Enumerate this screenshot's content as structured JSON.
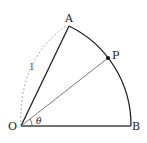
{
  "diagram": {
    "type": "sector",
    "points": {
      "O": {
        "label": "O"
      },
      "A": {
        "label": "A"
      },
      "B": {
        "label": "B"
      },
      "P": {
        "label": "P"
      }
    },
    "radius_label": "1",
    "angle_label": "θ",
    "colors": {
      "stroke": "#222222",
      "dashed": "#999999",
      "segment_op": "#777777"
    }
  }
}
